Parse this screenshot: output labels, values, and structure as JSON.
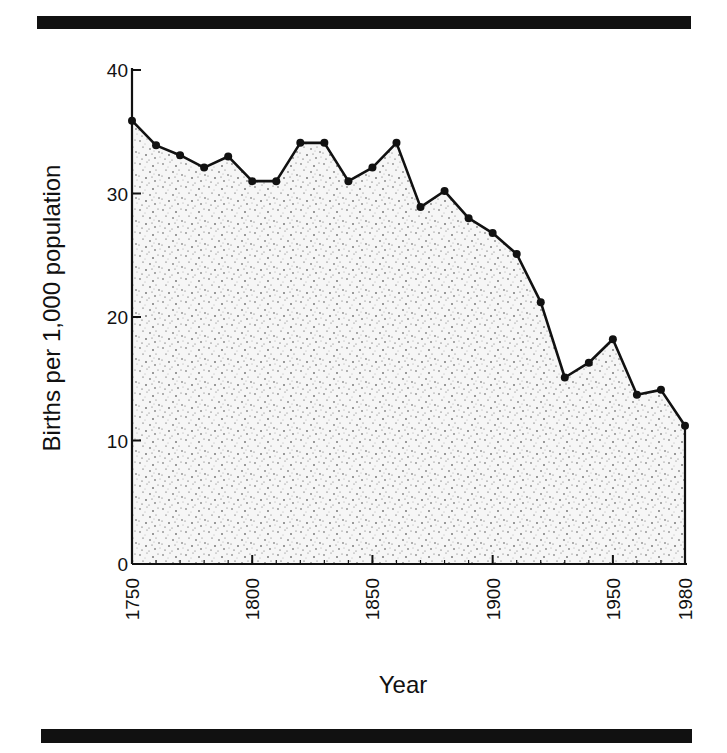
{
  "chart_data": {
    "type": "area",
    "title": "",
    "xlabel": "Year",
    "ylabel": "Births per 1,000 population",
    "xlim": [
      1750,
      1980
    ],
    "ylim": [
      0,
      40
    ],
    "grid": false,
    "legend": null,
    "x_tick_labels": [
      "1750",
      "1800",
      "1850",
      "1900",
      "1950",
      "1980"
    ],
    "y_tick_labels": [
      "0",
      "10",
      "20",
      "30",
      "40"
    ],
    "x": [
      1750,
      1760,
      1770,
      1780,
      1790,
      1800,
      1810,
      1820,
      1830,
      1840,
      1850,
      1860,
      1870,
      1880,
      1890,
      1900,
      1910,
      1920,
      1930,
      1940,
      1950,
      1960,
      1970,
      1980
    ],
    "series": [
      {
        "name": "Birth rate",
        "values": [
          35.9,
          33.9,
          33.1,
          32.1,
          33.0,
          31.0,
          31.0,
          34.1,
          34.1,
          31.0,
          32.1,
          34.1,
          28.9,
          30.2,
          28.0,
          26.8,
          25.1,
          21.2,
          15.1,
          16.3,
          18.2,
          13.7,
          14.1,
          11.2
        ]
      }
    ],
    "style": {
      "fill": "stippled",
      "line_color": "#111111",
      "marker": "filled-circle"
    }
  },
  "labels": {
    "xlabel": "Year",
    "ylabel": "Births per 1,000 population"
  }
}
